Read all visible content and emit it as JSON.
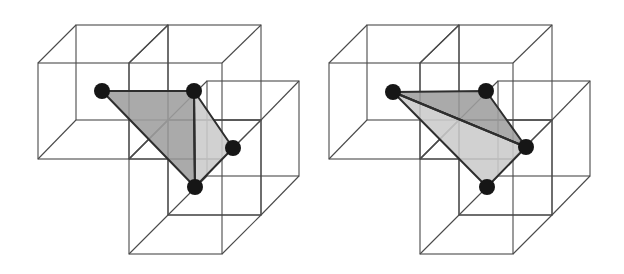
{
  "figure": {
    "width": 624,
    "height": 274,
    "background": "#ffffff",
    "colors": {
      "cube_edge": "#4a4a4a",
      "polygon_edge": "#2e2e2e",
      "dark_triangle": "#9e9e9e",
      "light_triangle": "#cbcbcb",
      "vertex": "#161616"
    },
    "panels": [
      {
        "name": "left-triangulation",
        "offset_x": 0,
        "cubes": [
          {
            "name": "cube-top-left",
            "front": [
              38,
              63,
              129,
              159
            ],
            "back": [
              76,
              25,
              168,
              120
            ]
          },
          {
            "name": "cube-top-right",
            "front": [
              129,
              63,
              222,
              159
            ],
            "back": [
              168,
              25,
              261,
              120
            ]
          },
          {
            "name": "cube-back-right",
            "front": [
              168,
              120,
              261,
              215
            ],
            "back": [
              207,
              81,
              299,
              176
            ]
          },
          {
            "name": "cube-bottom",
            "front": [
              129,
              159,
              222,
              254
            ],
            "back": [
              168,
              120,
              261,
              215
            ]
          }
        ],
        "vertices": [
          [
            102,
            91
          ],
          [
            194,
            91
          ],
          [
            233,
            148
          ],
          [
            195,
            187
          ]
        ],
        "triangles": [
          {
            "name": "triangle-dark",
            "points": [
              0,
              1,
              3
            ],
            "shade": "dark"
          },
          {
            "name": "triangle-light",
            "points": [
              1,
              2,
              3
            ],
            "shade": "light"
          }
        ],
        "diagonal": [
          1,
          3
        ]
      },
      {
        "name": "right-triangulation",
        "offset_x": 291,
        "cubes": [
          {
            "name": "cube-top-left",
            "front": [
              38,
              63,
              129,
              159
            ],
            "back": [
              76,
              25,
              168,
              120
            ]
          },
          {
            "name": "cube-top-right",
            "front": [
              129,
              63,
              222,
              159
            ],
            "back": [
              168,
              25,
              261,
              120
            ]
          },
          {
            "name": "cube-back-right",
            "front": [
              168,
              120,
              261,
              215
            ],
            "back": [
              207,
              81,
              299,
              176
            ]
          },
          {
            "name": "cube-bottom",
            "front": [
              129,
              159,
              222,
              254
            ],
            "back": [
              168,
              120,
              261,
              215
            ]
          }
        ],
        "vertices": [
          [
            102,
            92
          ],
          [
            195,
            91
          ],
          [
            235,
            147
          ],
          [
            196,
            187
          ]
        ],
        "triangles": [
          {
            "name": "triangle-dark",
            "points": [
              0,
              1,
              2
            ],
            "shade": "dark"
          },
          {
            "name": "triangle-light",
            "points": [
              0,
              2,
              3
            ],
            "shade": "light"
          }
        ],
        "diagonal": [
          0,
          2
        ]
      }
    ],
    "vertex_radius": 8
  }
}
